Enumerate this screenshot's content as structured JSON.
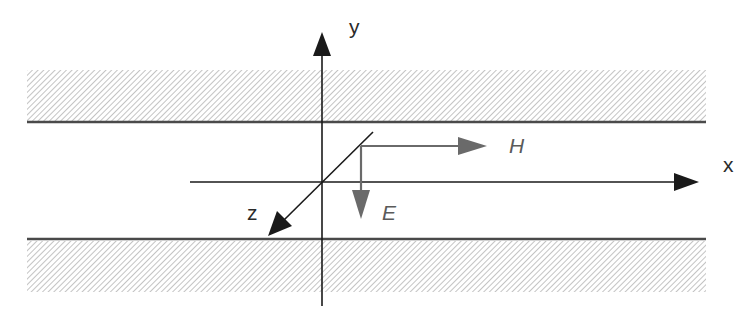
{
  "diagram": {
    "axes": {
      "x": {
        "label": "x"
      },
      "y": {
        "label": "y"
      },
      "z": {
        "label": "z"
      }
    },
    "fields": {
      "H": {
        "label": "H",
        "direction": "+x"
      },
      "E": {
        "label": "E",
        "direction": "-y"
      }
    },
    "plates": [
      {
        "name": "upper-plate",
        "hatched": true
      },
      {
        "name": "lower-plate",
        "hatched": true
      }
    ],
    "colors": {
      "axis": "#1a1a1a",
      "field_vector": "#6a6a6a",
      "plate_line": "#4a4a4a",
      "hatch": "#9a9a9a"
    }
  }
}
